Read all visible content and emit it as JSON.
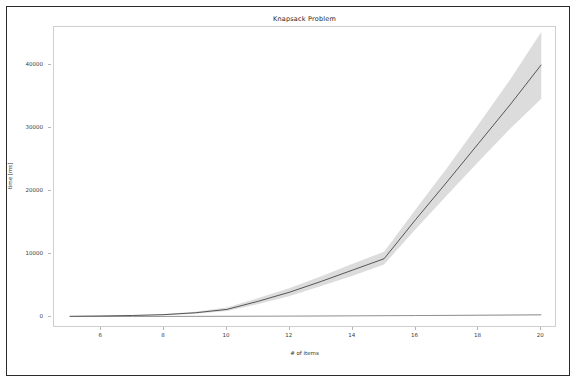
{
  "figure": {
    "background_color": "#ffffff",
    "frame_color": "#2b2b2b",
    "axes_spine_color": "#cfcfcf"
  },
  "chart_data": {
    "type": "line",
    "title": "Knapsack Problem",
    "xlabel": "# of items",
    "ylabel": "time [ms]",
    "x": [
      5,
      6,
      7,
      8,
      9,
      10,
      11,
      12,
      13,
      14,
      15,
      16,
      17,
      18,
      19,
      20
    ],
    "xlim": [
      4.5,
      20.5
    ],
    "ylim": [
      -1800,
      46000
    ],
    "xticks": [
      6,
      8,
      10,
      12,
      14,
      16,
      18,
      20
    ],
    "xticklabels": [
      "6",
      "8",
      "10",
      "12",
      "14",
      "16",
      "18",
      "20"
    ],
    "yticks": [
      0,
      10000,
      20000,
      30000,
      40000
    ],
    "yticklabels": [
      "0",
      "10000",
      "20000",
      "30000",
      "40000"
    ],
    "grid": false,
    "legend": false,
    "series": [
      {
        "name": "exhaustive",
        "color": "#333333",
        "linewidth": 0.8,
        "band_color": "#d6d6d6",
        "band_opacity": 0.85,
        "values": [
          60,
          110,
          190,
          320,
          620,
          1150,
          2450,
          3900,
          5600,
          7400,
          9200,
          15400,
          21400,
          27500,
          33600,
          40000
        ],
        "band_low": [
          40,
          80,
          140,
          240,
          480,
          900,
          2000,
          3300,
          4850,
          6500,
          8300,
          13900,
          19300,
          24600,
          29800,
          34600
        ],
        "band_high": [
          90,
          150,
          250,
          420,
          790,
          1450,
          2950,
          4550,
          6400,
          8400,
          10300,
          17000,
          23600,
          30500,
          37600,
          45200
        ]
      },
      {
        "name": "dynamic-programming",
        "color": "#666666",
        "linewidth": 0.7,
        "band_color": "#dcdcdc",
        "band_opacity": 0.8,
        "values": [
          20,
          25,
          32,
          40,
          50,
          62,
          76,
          92,
          110,
          130,
          152,
          176,
          202,
          230,
          260,
          292
        ],
        "band_low": [
          12,
          16,
          21,
          27,
          35,
          44,
          55,
          67,
          81,
          97,
          114,
          133,
          154,
          177,
          201,
          227
        ],
        "band_high": [
          30,
          36,
          45,
          55,
          67,
          82,
          99,
          118,
          140,
          164,
          191,
          220,
          252,
          286,
          323,
          362
        ]
      }
    ]
  }
}
